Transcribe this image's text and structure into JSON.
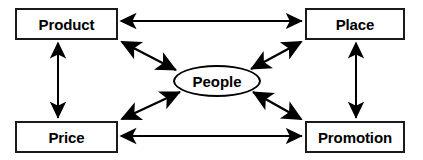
{
  "diagram": {
    "type": "relationship-diagram",
    "background_color": "#ffffff",
    "line_color": "#000000",
    "box_border_color": "#1a1a1a",
    "text_color": "#000000",
    "nodes": [
      {
        "id": "product",
        "label": "Product",
        "shape": "rectangle",
        "x": 15,
        "y": 8,
        "w": 103,
        "h": 32
      },
      {
        "id": "place",
        "label": "Place",
        "shape": "rectangle",
        "x": 305,
        "y": 8,
        "w": 100,
        "h": 32
      },
      {
        "id": "people",
        "label": "People",
        "shape": "ellipse",
        "x": 173,
        "y": 65,
        "w": 88,
        "h": 32
      },
      {
        "id": "price",
        "label": "Price",
        "shape": "rectangle",
        "x": 15,
        "y": 121,
        "w": 103,
        "h": 32
      },
      {
        "id": "promotion",
        "label": "Promotion",
        "shape": "rectangle",
        "x": 305,
        "y": 121,
        "w": 100,
        "h": 32
      }
    ],
    "connectors": [
      {
        "id": "product-place",
        "from": "product",
        "to": "place",
        "style": "double-arrow",
        "orientation": "horizontal"
      },
      {
        "id": "price-promotion",
        "from": "price",
        "to": "promotion",
        "style": "double-arrow",
        "orientation": "horizontal"
      },
      {
        "id": "product-price",
        "from": "product",
        "to": "price",
        "style": "double-arrow",
        "orientation": "vertical"
      },
      {
        "id": "place-promotion",
        "from": "place",
        "to": "promotion",
        "style": "double-arrow",
        "orientation": "vertical"
      },
      {
        "id": "product-people",
        "from": "product",
        "to": "people",
        "style": "double-arrow",
        "orientation": "diagonal"
      },
      {
        "id": "place-people",
        "from": "place",
        "to": "people",
        "style": "double-arrow",
        "orientation": "diagonal"
      },
      {
        "id": "price-people",
        "from": "price",
        "to": "people",
        "style": "double-arrow",
        "orientation": "diagonal"
      },
      {
        "id": "promotion-people",
        "from": "promotion",
        "to": "people",
        "style": "double-arrow",
        "orientation": "diagonal"
      }
    ]
  }
}
